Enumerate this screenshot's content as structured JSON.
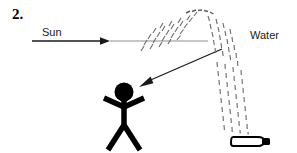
{
  "figure": {
    "item_number": "2.",
    "labels": {
      "sun": "Sun",
      "water": "Water"
    },
    "colors": {
      "ink": "#000000",
      "text": "#1a1a1a",
      "ray_line": "#8a8a8a",
      "ray_head": "#1a1a1a",
      "spray": "#6e6e6e",
      "figure": "#000000",
      "background": "#ffffff"
    },
    "elements": {
      "sun_ray_arrow": "horizontal-arrow-left-to-right",
      "water_spray_arc": "dotted-arc-spray",
      "reflected_ray_arrow": "diagonal-arrow-to-person",
      "person": "stick-figure",
      "spray_bottle": "horizontal-spray-bottle"
    },
    "geometry": {
      "width": 297,
      "height": 153,
      "sun_line_start_x": 32,
      "sun_line_end_x": 208,
      "sun_line_y": 41,
      "sun_arrowhead_x": 106,
      "arc_apex_x": 200,
      "arc_apex_y": 11,
      "bottle_x": 232,
      "bottle_y": 136,
      "person_head_cx": 124,
      "person_head_cy": 92
    }
  }
}
